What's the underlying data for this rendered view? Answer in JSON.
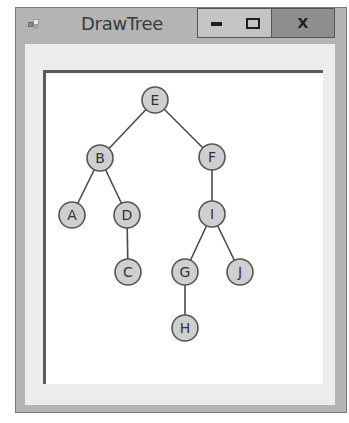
{
  "window": {
    "title": "DrawTree",
    "icon": "app-window-icon",
    "controls": {
      "minimize": {
        "icon": "minimize-icon",
        "glyph": "—"
      },
      "maximize": {
        "icon": "maximize-icon",
        "glyph": "□"
      },
      "close": {
        "icon": "close-icon",
        "glyph": "X"
      }
    }
  },
  "colors": {
    "frame": "#b4b4b4",
    "client": "#ececec",
    "canvas": "#ffffff",
    "node_fill": "#cfcfcf",
    "node_stroke": "#555555",
    "edge": "#4a4a4a",
    "close_button": "#8e8e8e"
  },
  "tree": {
    "node_radius": 13,
    "nodes": [
      {
        "id": "E",
        "label": "E",
        "x": 155,
        "y": 100
      },
      {
        "id": "B",
        "label": "B",
        "x": 100,
        "y": 158
      },
      {
        "id": "F",
        "label": "F",
        "x": 212,
        "y": 157
      },
      {
        "id": "A",
        "label": "A",
        "x": 72,
        "y": 215
      },
      {
        "id": "D",
        "label": "D",
        "x": 127,
        "y": 215
      },
      {
        "id": "I",
        "label": "I",
        "x": 212,
        "y": 214
      },
      {
        "id": "C",
        "label": "C",
        "x": 128,
        "y": 272
      },
      {
        "id": "G",
        "label": "G",
        "x": 185,
        "y": 272
      },
      {
        "id": "J",
        "label": "J",
        "x": 240,
        "y": 272
      },
      {
        "id": "H",
        "label": "H",
        "x": 185,
        "y": 328
      }
    ],
    "edges": [
      {
        "from": "E",
        "to": "B"
      },
      {
        "from": "E",
        "to": "F"
      },
      {
        "from": "B",
        "to": "A"
      },
      {
        "from": "B",
        "to": "D"
      },
      {
        "from": "D",
        "to": "C"
      },
      {
        "from": "F",
        "to": "I"
      },
      {
        "from": "I",
        "to": "G"
      },
      {
        "from": "I",
        "to": "J"
      },
      {
        "from": "G",
        "to": "H"
      }
    ]
  }
}
